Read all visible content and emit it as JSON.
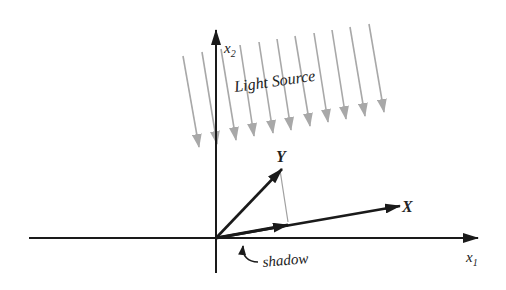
{
  "diagram": {
    "title_label": "Light Source",
    "axes": {
      "x_label": "x",
      "x_sub": "1",
      "y_label": "x",
      "y_sub": "2"
    },
    "vectors": {
      "X": "X",
      "Y": "Y"
    },
    "shadow_label": "shadow",
    "colors": {
      "axis": "#1a1a1a",
      "vector": "#1a1a1a",
      "light_ray": "#a8a8a8",
      "projection_line": "#a0a0a0",
      "background": "#ffffff"
    },
    "light_ray_count": 11
  }
}
